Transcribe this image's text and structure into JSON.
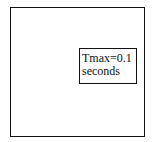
{
  "diagram": {
    "label": {
      "line1": "Tmax=0.1",
      "line2": "seconds"
    },
    "colors": {
      "stroke": "#111111",
      "background": "#ffffff"
    }
  }
}
